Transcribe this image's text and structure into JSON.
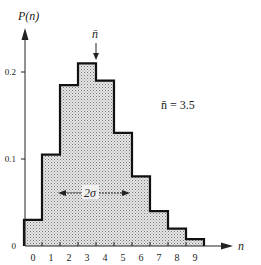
{
  "chart_data": {
    "type": "bar",
    "title": "",
    "xlabel": "n",
    "ylabel": "P(n)",
    "categories": [
      "0",
      "1",
      "2",
      "3",
      "4",
      "5",
      "6",
      "7",
      "8",
      "9"
    ],
    "values": [
      0.03,
      0.105,
      0.185,
      0.21,
      0.19,
      0.13,
      0.08,
      0.04,
      0.02,
      0.008
    ],
    "ylim": [
      0,
      0.25
    ],
    "yticks": [
      "0",
      "0.1",
      "0.2"
    ],
    "grid": false,
    "annotations": {
      "mean_label": "n̄",
      "mean_text": "n̄  =  3.5",
      "mean_value": 3.5,
      "width_label": "2σ"
    },
    "style": "step histogram, stippled fill"
  },
  "colors": {
    "fill": "#d8d8d8",
    "stroke": "#111111"
  }
}
